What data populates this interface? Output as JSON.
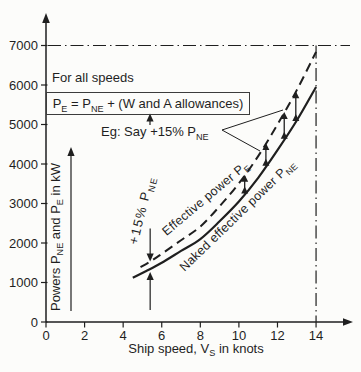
{
  "figure": {
    "background": "#fcfcfa",
    "ink_color": "#1f1f1f"
  },
  "chart_data": {
    "type": "line",
    "title": "",
    "xlabel": "Ship speed, V_[S] in knots",
    "ylabel": "Powers P_[NE] and P_[E] in kW",
    "xlim": [
      0,
      15.6
    ],
    "ylim": [
      0,
      7700
    ],
    "grid": false,
    "x_ticks": [
      0,
      2,
      4,
      6,
      8,
      10,
      12,
      14
    ],
    "y_ticks": [
      0,
      1000,
      2000,
      3000,
      4000,
      5000,
      6000,
      7000
    ],
    "series": [
      {
        "name": "Naked effective power P_[NE]",
        "line_style": "solid",
        "x": [
          4.5,
          5.2,
          6,
          7,
          8,
          9,
          10,
          11,
          12,
          13,
          14
        ],
        "y": [
          1120,
          1290,
          1500,
          1800,
          2100,
          2550,
          3050,
          3650,
          4350,
          5100,
          5950
        ]
      },
      {
        "name": "Effective power P_[E]",
        "line_style": "dashed",
        "x": [
          4.9,
          5.5,
          6,
          7,
          8,
          9,
          10,
          11,
          12,
          13,
          14
        ],
        "y": [
          1390,
          1560,
          1725,
          2070,
          2415,
          2930,
          3510,
          4200,
          5000,
          5870,
          6840
        ]
      }
    ],
    "relationship": "P_E = 1.15 × P_NE (example allowance of +15%)",
    "reference_lines": [
      {
        "axis": "y",
        "value": 7000,
        "style": "dash-dot"
      },
      {
        "axis": "x",
        "value": 14,
        "style": "dash-dot"
      }
    ],
    "allowance_arrow_speeds": [
      10.3,
      11.4,
      12.35,
      12.95
    ],
    "allowance_gap_arrow_speed": 5.4,
    "legend_position": "labels-along-curves"
  },
  "annotations": {
    "for_all_speeds": "For all speeds",
    "formula": "P_[E] = P_[NE] + (W and A allowances)",
    "example": "Eg: Say +15% P_[NE]",
    "allowance_label": "+15% P_[NE]"
  }
}
